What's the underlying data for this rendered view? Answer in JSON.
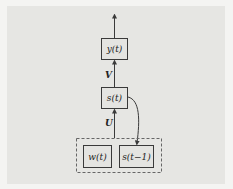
{
  "nodes": {
    "output": "y(t)",
    "state": "s(t)",
    "input_word": "w(t)",
    "prev_state": "s(t−1)"
  },
  "edge_labels": {
    "state_to_output": "V",
    "input_to_state": "U"
  },
  "colors": {
    "background": "#e6e6e3",
    "stroke": "#3a3a3a"
  }
}
